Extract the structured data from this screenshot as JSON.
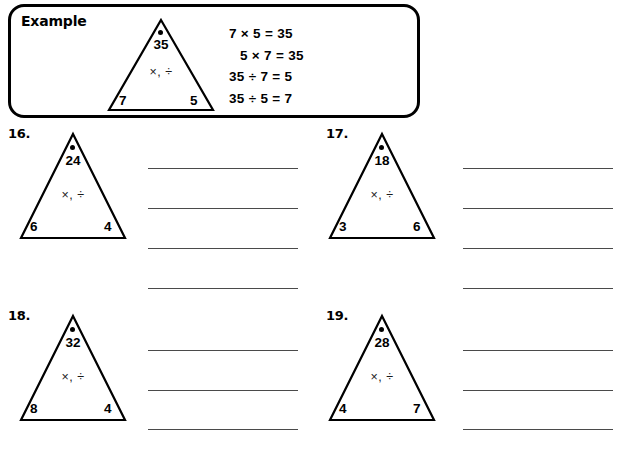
{
  "page": {
    "width": 618,
    "height": 467,
    "background": "#ffffff",
    "ink": "#000000",
    "line_color": "#4a4a4a"
  },
  "example": {
    "label": "Example",
    "triangle": {
      "top": "35",
      "operators": "×, ÷",
      "left": "7",
      "right": "5",
      "dot": "apex-dot"
    },
    "equations": [
      "7 × 5 = 35",
      "5 × 7 = 35",
      "35 ÷ 7 = 5",
      "35 ÷ 5 = 7"
    ]
  },
  "problems": [
    {
      "number": "16.",
      "triangle": {
        "top": "24",
        "operators": "×, ÷",
        "left": "6",
        "right": "4",
        "dot": "apex-dot"
      },
      "answer_lines": 4
    },
    {
      "number": "17.",
      "triangle": {
        "top": "18",
        "operators": "×, ÷",
        "left": "3",
        "right": "6",
        "dot": "apex-dot"
      },
      "answer_lines": 4
    },
    {
      "number": "18.",
      "triangle": {
        "top": "32",
        "operators": "×, ÷",
        "left": "8",
        "right": "4",
        "dot": "apex-dot"
      },
      "answer_lines": 3
    },
    {
      "number": "19.",
      "triangle": {
        "top": "28",
        "operators": "×, ÷",
        "left": "4",
        "right": "7",
        "dot": "apex-dot"
      },
      "answer_lines": 3
    }
  ]
}
